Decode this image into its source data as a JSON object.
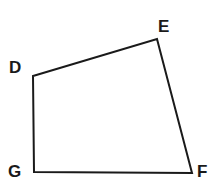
{
  "figure": {
    "kind": "quadrilateral-diagram",
    "name": "DEFG",
    "background_color": "#ffffff",
    "stroke_color": "#1a1a1a",
    "stroke_width": 2,
    "label_color": "#1a1a1a",
    "vertices": [
      {
        "id": "D",
        "label": "D",
        "x": 33,
        "y": 76,
        "label_x": 9,
        "label_y": 59
      },
      {
        "id": "E",
        "label": "E",
        "x": 157,
        "y": 39,
        "label_x": 158,
        "label_y": 18
      },
      {
        "id": "F",
        "label": "F",
        "x": 192,
        "y": 173,
        "label_x": 197,
        "label_y": 163
      },
      {
        "id": "G",
        "label": "G",
        "x": 34,
        "y": 172,
        "label_x": 8,
        "label_y": 163
      }
    ],
    "edges": [
      {
        "id": "DE",
        "from": "D",
        "to": "E"
      },
      {
        "id": "EF",
        "from": "E",
        "to": "F"
      },
      {
        "id": "FG",
        "from": "F",
        "to": "G"
      },
      {
        "id": "GD",
        "from": "G",
        "to": "D"
      }
    ],
    "polygon_points": "33,76 157,39 192,173 34,172",
    "labels": {
      "D": "D",
      "E": "E",
      "F": "F",
      "G": "G"
    }
  }
}
